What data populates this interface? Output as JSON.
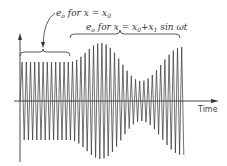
{
  "diagram": {
    "type": "amplitude-modulated waveform",
    "axes": {
      "x_label": "Time",
      "y_label": ""
    },
    "annotations": [
      {
        "id": "constant",
        "text_prefix": "e",
        "text_sub": "o",
        "text_mid": " for x = x",
        "text_sub2": "0",
        "text_suffix": ""
      },
      {
        "id": "modulated",
        "text_prefix": "e",
        "text_sub": "o",
        "text_mid": " for x = x",
        "text_sub2": "0",
        "text_mid2": "+x",
        "text_sub3": "1",
        "text_suffix": " sin ωt"
      }
    ],
    "colors": {
      "line": "#333333",
      "background": "#ffffff"
    },
    "segments": {
      "constant": {
        "x_start": 20,
        "x_end": 70,
        "amplitude_px": 39
      },
      "modulated": {
        "x_start": 70,
        "x_end": 182,
        "peak_x": 101,
        "peak_amp_px": 58,
        "min_x": 141,
        "min_amp_px": 20,
        "end_amp_px": 54
      }
    }
  }
}
